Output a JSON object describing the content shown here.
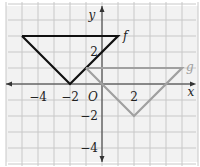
{
  "chart_data": {
    "type": "line",
    "title": "",
    "xlabel": "x",
    "ylabel": "y",
    "origin_label": "O",
    "xlim": [
      -6,
      6
    ],
    "ylim": [
      -5,
      5
    ],
    "grid": true,
    "x_tick_labels": [
      {
        "value": -4,
        "label": "−4"
      },
      {
        "value": -2,
        "label": "−2"
      },
      {
        "value": 2,
        "label": "2"
      }
    ],
    "y_tick_labels": [
      {
        "value": 2,
        "label": "2"
      },
      {
        "value": -2,
        "label": "−2"
      },
      {
        "value": -4,
        "label": "−4"
      }
    ],
    "series": [
      {
        "name": "f",
        "color": "#111111",
        "points": [
          [
            -5,
            3
          ],
          [
            -2,
            0
          ],
          [
            1,
            3
          ],
          [
            -5,
            3
          ]
        ]
      },
      {
        "name": "g",
        "color": "#a0a0a0",
        "points": [
          [
            -1,
            1
          ],
          [
            2,
            -2
          ],
          [
            5,
            1
          ],
          [
            -1,
            1
          ]
        ]
      }
    ]
  },
  "colors": {
    "grid": "#c8c8c8",
    "grid_bg": "#f2f2f2",
    "axis": "#333333"
  }
}
